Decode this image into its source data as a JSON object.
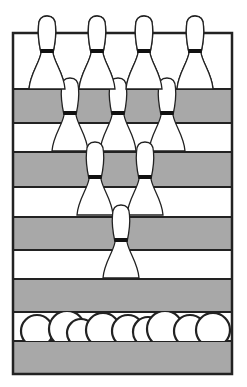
{
  "illustration": {
    "subject": "bowling-pins-and-balls",
    "colors": {
      "background": "#ffffff",
      "band_gray": "#a8a8a8",
      "outline": "#222222",
      "pin_fill": "#ffffff",
      "pin_stripe": "#111111"
    },
    "frame": {
      "x": 13,
      "y": 33,
      "width": 219,
      "height": 341
    },
    "bands": [
      {
        "y1": 33,
        "y2": 89,
        "fill": "white"
      },
      {
        "y1": 89,
        "y2": 123,
        "fill": "gray"
      },
      {
        "y1": 123,
        "y2": 152,
        "fill": "white"
      },
      {
        "y1": 152,
        "y2": 187,
        "fill": "gray"
      },
      {
        "y1": 187,
        "y2": 217,
        "fill": "white"
      },
      {
        "y1": 217,
        "y2": 250,
        "fill": "gray"
      },
      {
        "y1": 250,
        "y2": 279,
        "fill": "white"
      },
      {
        "y1": 279,
        "y2": 312,
        "fill": "gray"
      },
      {
        "y1": 312,
        "y2": 341,
        "fill": "white"
      },
      {
        "y1": 341,
        "y2": 374,
        "fill": "gray"
      }
    ],
    "pin_rows": [
      {
        "top": 16,
        "centers": [
          47,
          97,
          144,
          195
        ]
      },
      {
        "top": 78,
        "centers": [
          70,
          118,
          167
        ]
      },
      {
        "top": 142,
        "centers": [
          95,
          145
        ]
      },
      {
        "top": 205,
        "centers": [
          121
        ]
      }
    ],
    "balls": {
      "baseline": 341,
      "items": [
        {
          "cx": 37,
          "r": 16
        },
        {
          "cx": 67,
          "r": 18
        },
        {
          "cx": 81,
          "r": 14
        },
        {
          "cx": 103,
          "r": 17
        },
        {
          "cx": 128,
          "r": 16
        },
        {
          "cx": 148,
          "r": 15
        },
        {
          "cx": 165,
          "r": 18
        },
        {
          "cx": 190,
          "r": 16
        },
        {
          "cx": 213,
          "r": 17
        }
      ]
    }
  }
}
